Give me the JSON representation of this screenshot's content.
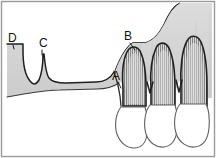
{
  "figure": {
    "name": "periodontal-bone-level-diagram",
    "width": 216,
    "height": 158,
    "background_color": "#ffffff",
    "border_color": "#9a9a9a"
  },
  "labels": [
    {
      "id": "A",
      "text": "A",
      "x": 117,
      "y": 78,
      "description": "bone margin along root surface"
    },
    {
      "id": "B",
      "text": "B",
      "x": 128,
      "y": 38,
      "description": "interdental bone crest"
    },
    {
      "id": "C",
      "text": "C",
      "x": 43,
      "y": 46,
      "description": "narrow bony spike on edentulous ridge"
    },
    {
      "id": "D",
      "text": "D",
      "x": 11,
      "y": 41,
      "description": "flat edentulous ridge step"
    }
  ],
  "leaders": [
    {
      "for": "A",
      "path": "M 117 81 L 122 88"
    },
    {
      "for": "B",
      "path": "M 130 42 L 134 50"
    },
    {
      "for": "C",
      "path": "M 43 49 L 42 55"
    },
    {
      "for": "D",
      "path": "M 13 44 L 14 50"
    }
  ],
  "colors": {
    "bone_fill": "#d2d2d2",
    "bone_fill_light": "#dcdcdc",
    "outline": "#1c1c1c",
    "outline_soft": "#4a4a4a",
    "crown_fill": "#ffffff",
    "crown_stroke": "#5a5a5a",
    "root_fill": "#cfcfcf",
    "pdl_stroke": "#6e6e6e",
    "frame": "#9a9a9a"
  },
  "shapes": {
    "bone_body": "M 7 44 L 23 44 L 23 50 C 23 62 25 74 30 80 C 33 84 36 84 39 80 C 42 74 43 62 43 55 L 44 55 C 45 64 46 74 49 78 C 52 82 58 83 66 83 L 96 82 C 104 82 110 79 114 72 C 118 62 122 52 128 46 L 132 43 L 145 43 C 152 41 158 34 163 24 C 168 14 172 8 178 5 L 209 5 L 209 95 L 196 95 C 190 93 186 90 184 86 L 182 80 L 178 80 L 176 86 C 174 90 170 92 165 93 L 160 93 L 156 87 L 152 80 L 148 80 L 145 86 C 143 90 139 92 134 93 L 128 93 L 124 86 L 121 80 L 118 82 C 112 86 105 88 96 88 L 60 89 C 48 89 36 91 24 93 L 7 96 Z",
    "sinus_cutout": "M 178 5 C 172 8 168 14 163 24 C 158 34 152 41 145 43 L 132 43 L 128 46 C 122 52 118 62 114 72 L 114 5 Z",
    "root_1": "M 122 88 C 121 76 122 62 126 54 C 129 48 134 47 138 52 C 142 59 144 72 144 86 L 144 104 L 122 104 Z",
    "root_2": "M 150 88 C 149 74 151 58 155 50 C 158 44 163 43 167 49 C 171 57 173 72 173 88 L 173 104 L 150 104 Z",
    "root_3": "M 180 86 C 179 70 181 52 186 43 C 189 37 195 36 199 43 C 203 51 205 68 205 86 L 205 104 L 180 104 Z",
    "crown_1": "M 120 106 C 116 112 115 124 118 133 C 121 142 128 147 134 147 C 141 147 146 142 147 134 C 148 124 147 112 145 106 Z",
    "crown_2": "M 149 104 C 145 110 144 124 147 133 C 150 142 157 147 164 146 C 171 145 175 139 176 130 C 177 120 176 110 174 104 Z",
    "crown_3": "M 179 102 C 174 108 173 122 176 132 C 179 142 187 147 194 146 C 202 145 207 138 208 128 C 209 117 207 107 205 102 Z"
  },
  "structure_names": {
    "bone": "alveolar-bone",
    "sinus": "maxillary-sinus-region",
    "roots": "tooth-roots",
    "crowns": "tooth-crowns",
    "pdl": "periodontal-ligament-hatching"
  }
}
